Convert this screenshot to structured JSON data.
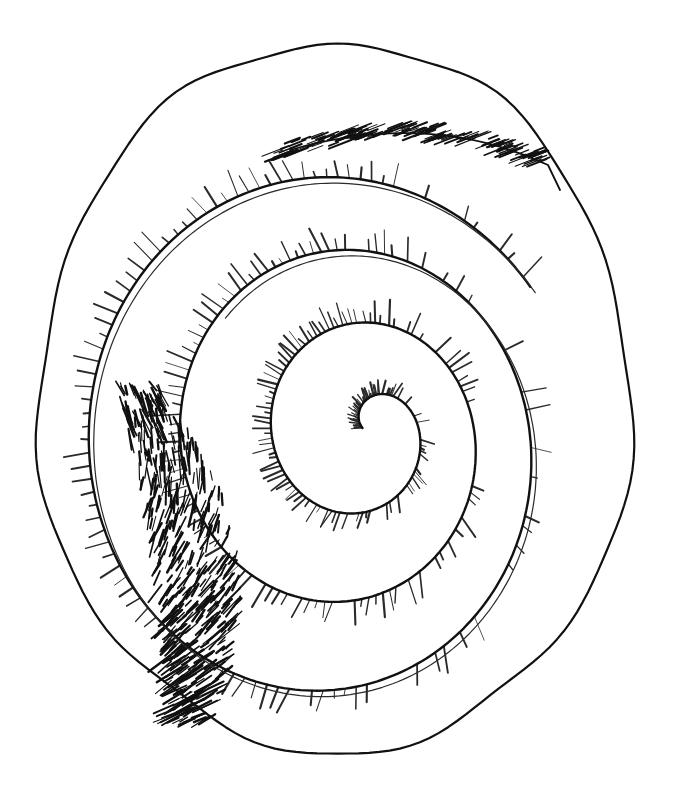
{
  "artwork": {
    "kind": "hand-drawn ink sketch",
    "subject": "spiral shell / coiled form",
    "caption": "",
    "colors": {
      "background": "#ffffff",
      "ink": "#111111",
      "ink_light": "#2a2a2a"
    },
    "outer_shell": {
      "center": [
        338,
        410
      ],
      "rx": 300,
      "ry": 368,
      "lip_notch": [
        548,
        165
      ]
    },
    "spiral": {
      "center": [
        378,
        428
      ],
      "turns": 3.4,
      "start_radius": 14,
      "growth_per_turn": 72
    },
    "dark_wedge": {
      "region": "left side",
      "approx_bounds": [
        95,
        380,
        230,
        720
      ]
    },
    "hatching": {
      "style": "radial short strokes along spiral band",
      "density": "heavy on left/top, lighter on bottom-right"
    }
  }
}
